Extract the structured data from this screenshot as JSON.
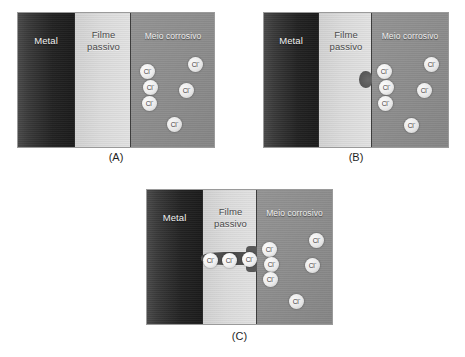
{
  "figure": {
    "title_caption_style": "(A) (B) (C)",
    "panels": [
      {
        "id": "A",
        "caption": "(A)",
        "regions": {
          "metal": "Metal",
          "film": "Filme\npassivo",
          "medium": "Meio corrosivo"
        },
        "ion_label": "Cl",
        "ion_charge": "-",
        "ion_count": 7,
        "pit_state": "none",
        "ions": [
          {
            "x": 57,
            "y": 44
          },
          {
            "x": 101,
            "y": 52
          },
          {
            "x": 9,
            "y": 51
          },
          {
            "x": 12,
            "y": 67
          },
          {
            "x": 48,
            "y": 70
          },
          {
            "x": 11,
            "y": 83
          },
          {
            "x": 88,
            "y": 94
          },
          {
            "x": 36,
            "y": 104
          }
        ]
      },
      {
        "id": "B",
        "caption": "(B)",
        "regions": {
          "metal": "Metal",
          "film": "Filme\npassivo",
          "medium": "Meio corrosivo"
        },
        "ion_label": "Cl",
        "ion_charge": "-",
        "ion_count": 7,
        "pit_state": "incipient-notch",
        "ions": [
          {
            "x": 57,
            "y": 44
          },
          {
            "x": 101,
            "y": 52
          },
          {
            "x": 9,
            "y": 51
          },
          {
            "x": 12,
            "y": 67
          },
          {
            "x": 48,
            "y": 70
          },
          {
            "x": 11,
            "y": 83
          },
          {
            "x": 88,
            "y": 94
          },
          {
            "x": 36,
            "y": 104
          }
        ]
      },
      {
        "id": "C",
        "caption": "(C)",
        "regions": {
          "metal": "Metal",
          "film": "Filme\npassivo",
          "medium": "Meio corrosivo"
        },
        "ion_label": "Cl",
        "ion_charge": "-",
        "ion_count": 10,
        "pit_state": "penetrating-channel",
        "ions": [
          {
            "x": 57,
            "y": 44
          },
          {
            "x": 101,
            "y": 52
          },
          {
            "x": 9,
            "y": 51
          },
          {
            "x": 12,
            "y": 67
          },
          {
            "x": 48,
            "y": 70
          },
          {
            "x": 11,
            "y": 83
          },
          {
            "x": 88,
            "y": 94
          },
          {
            "x": 36,
            "y": 104
          }
        ]
      }
    ],
    "colors": {
      "metal_dark": "#1b1b1b",
      "metal_light": "#494949",
      "film": "#dcdcdc",
      "medium": "#8d8d8d",
      "ion_fill": "#f5f5f5",
      "ion_text": "#3c3c3c",
      "pit": "#545454",
      "background": "#ffffff",
      "caption_text": "#1f1f1f"
    }
  }
}
